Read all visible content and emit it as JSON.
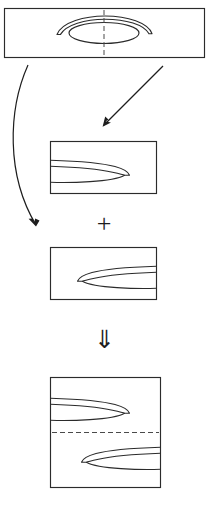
{
  "figure": {
    "kind": "technical-line-diagram",
    "background_color": "#ffffff",
    "line_color": "#2b2b2b",
    "dash_color": "#4a4a4a",
    "arrow_color": "#1d1d1d"
  },
  "panels": [
    {
      "id": "panel-source",
      "role": "source-field",
      "label": "",
      "frame": {
        "x": 4,
        "y": 8,
        "width": 201,
        "height": 50
      },
      "contents": [
        {
          "shape": "ellipse",
          "name": "central-ellipse"
        },
        {
          "shape": "crescent-arc",
          "name": "surrounding-crescent"
        },
        {
          "shape": "dashed-line",
          "name": "vertical-symmetry-axis",
          "orientation": "vertical"
        }
      ]
    },
    {
      "id": "panel-component-a",
      "role": "first-component",
      "label": "",
      "frame": {
        "x": 50,
        "y": 141,
        "width": 107,
        "height": 53
      },
      "contents": [
        {
          "shape": "half-lens",
          "name": "left-opening-lens",
          "facing": "left"
        }
      ]
    },
    {
      "id": "panel-component-b",
      "role": "second-component",
      "label": "",
      "frame": {
        "x": 50,
        "y": 247,
        "width": 107,
        "height": 53
      },
      "contents": [
        {
          "shape": "half-lens",
          "name": "right-opening-lens",
          "facing": "right"
        }
      ]
    },
    {
      "id": "panel-result",
      "role": "combined-result",
      "label": "",
      "frame": {
        "x": 50,
        "y": 377,
        "width": 111,
        "height": 111
      },
      "contents": [
        {
          "shape": "half-lens",
          "name": "left-opening-lens",
          "facing": "left"
        },
        {
          "shape": "dashed-line",
          "name": "horizontal-symmetry-axis",
          "orientation": "horizontal"
        },
        {
          "shape": "half-lens",
          "name": "right-opening-lens",
          "facing": "right"
        }
      ]
    }
  ],
  "operators": [
    {
      "id": "plus-operator",
      "glyph": "+",
      "meaning": "superposition"
    },
    {
      "id": "implies-operator",
      "glyph": "⇓",
      "meaning": "yields"
    }
  ],
  "connectors": [
    {
      "id": "curved-arrow-left",
      "style": "curved",
      "from": "panel-source",
      "to": "panel-component-b",
      "direction": "down"
    },
    {
      "id": "straight-arrow-diagonal",
      "style": "straight",
      "from": "panel-source",
      "to": "panel-component-a",
      "direction": "down-left"
    }
  ],
  "caption": {
    "text": ""
  }
}
